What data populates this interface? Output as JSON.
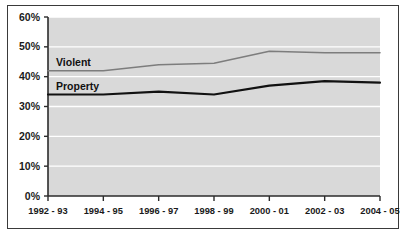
{
  "chart_data": {
    "type": "line",
    "title": "",
    "subtitle": "",
    "xlabel": "",
    "ylabel": "",
    "categories": [
      "1992 - 93",
      "1994 - 95",
      "1996 - 97",
      "1998 - 99",
      "2000 - 01",
      "2002 - 03",
      "2004 - 05"
    ],
    "series": [
      {
        "name": "Violent",
        "color": "#7d7d7d",
        "values": [
          42,
          42,
          44,
          44.5,
          48.5,
          48,
          48
        ]
      },
      {
        "name": "Property",
        "color": "#111111",
        "values": [
          34,
          34,
          35,
          34,
          37,
          38.5,
          38
        ]
      }
    ],
    "ylim": [
      0,
      60
    ],
    "yticks": [
      0,
      10,
      20,
      30,
      40,
      50,
      60
    ],
    "ytick_labels": [
      "0%",
      "10%",
      "20%",
      "30%",
      "40%",
      "50%",
      "60%"
    ],
    "grid": true,
    "grid_color": "#ffffff",
    "plot_background": "#d9d9d9",
    "legend_position": "inline-labels"
  },
  "figure": {
    "border_color": "#3a3a3a",
    "page_background": "#ffffff"
  }
}
